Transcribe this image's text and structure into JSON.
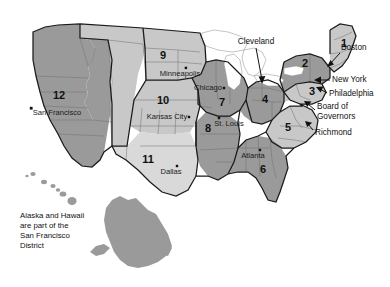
{
  "map": {
    "title": "Federal Reserve Districts Map",
    "caption_lines": [
      "Alaska and Hawaii",
      "are part of the",
      "San Francisco",
      "District"
    ],
    "colors": {
      "fill_dark": "#9a9a9a",
      "fill_light": "#c8c8c8",
      "fill_lighter": "#d9d9d9",
      "water": "#ffffff",
      "outline": "#1a1a1a",
      "state_line": "#6e6e6e",
      "text": "#111111",
      "background": "#ffffff"
    },
    "districts": [
      {
        "number": "1",
        "x": 344,
        "y": 44,
        "shade": "light"
      },
      {
        "number": "2",
        "x": 305,
        "y": 64,
        "shade": "dark"
      },
      {
        "number": "3",
        "x": 312,
        "y": 92,
        "shade": "light"
      },
      {
        "number": "4",
        "x": 265,
        "y": 100,
        "shade": "dark"
      },
      {
        "number": "5",
        "x": 288,
        "y": 128,
        "shade": "light"
      },
      {
        "number": "6",
        "x": 263,
        "y": 170,
        "shade": "dark"
      },
      {
        "number": "7",
        "x": 222,
        "y": 103,
        "shade": "dark"
      },
      {
        "number": "8",
        "x": 208,
        "y": 129,
        "shade": "dark"
      },
      {
        "number": "9",
        "x": 163,
        "y": 56,
        "shade": "light"
      },
      {
        "number": "10",
        "x": 163,
        "y": 101,
        "shade": "light"
      },
      {
        "number": "11",
        "x": 148,
        "y": 160,
        "shade": "lighter"
      },
      {
        "number": "12",
        "x": 59,
        "y": 96,
        "shade": "dark"
      }
    ],
    "cities": [
      {
        "name": "Minneapolis",
        "label_x": 180,
        "label_y": 74,
        "dot_x": 186,
        "dot_y": 68
      },
      {
        "name": "Chicago",
        "label_x": 208,
        "label_y": 88,
        "dot_x": 224,
        "dot_y": 88
      },
      {
        "name": "Kansas City",
        "label_x": 167,
        "label_y": 117,
        "dot_x": 189,
        "dot_y": 117
      },
      {
        "name": "St. Louis",
        "label_x": 229,
        "label_y": 124,
        "dot_x": 219,
        "dot_y": 118
      },
      {
        "name": "Dallas",
        "label_x": 171,
        "label_y": 172,
        "dot_x": 177,
        "dot_y": 166
      },
      {
        "name": "Atlanta",
        "label_x": 253,
        "label_y": 156,
        "dot_x": 260,
        "dot_y": 150
      },
      {
        "name": "San Francisco",
        "label_x": 57,
        "label_y": 113,
        "dot_x": 31,
        "dot_y": 108
      }
    ],
    "callouts": [
      {
        "name": "Cleveland",
        "label_x": 256,
        "label_y": 42,
        "align": "center"
      },
      {
        "name": "Boston",
        "label_x": 341,
        "label_y": 48,
        "align": "start"
      },
      {
        "name": "New York",
        "label_x": 332,
        "label_y": 80,
        "align": "start"
      },
      {
        "name": "Philadelphia",
        "label_x": 329,
        "label_y": 94,
        "align": "start"
      },
      {
        "name": "Board of",
        "label_x": 317,
        "label_y": 107,
        "align": "start"
      },
      {
        "name": "Governors",
        "label_x": 317,
        "label_y": 117,
        "align": "start"
      },
      {
        "name": "Richmond",
        "label_x": 315,
        "label_y": 133,
        "align": "start"
      }
    ]
  }
}
